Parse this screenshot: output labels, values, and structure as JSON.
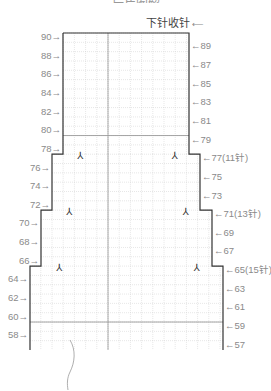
{
  "figure": {
    "top_title_partial": "后片图解",
    "caption": "下针收针",
    "caption_arrow": "⟵"
  },
  "grid": {
    "row_height_px": 5.33,
    "top_row": 90,
    "bottom_row": 57,
    "emphasis_lines_rows": [
      80,
      60
    ],
    "center_col_x": 108
  },
  "left_labels": [
    {
      "row": 90,
      "text": "90"
    },
    {
      "row": 88,
      "text": "88"
    },
    {
      "row": 86,
      "text": "86"
    },
    {
      "row": 84,
      "text": "84"
    },
    {
      "row": 82,
      "text": "82"
    },
    {
      "row": 80,
      "text": "80"
    },
    {
      "row": 78,
      "text": "78"
    },
    {
      "row": 76,
      "text": "76"
    },
    {
      "row": 74,
      "text": "74"
    },
    {
      "row": 72,
      "text": "72"
    },
    {
      "row": 70,
      "text": "70"
    },
    {
      "row": 68,
      "text": "68"
    },
    {
      "row": 66,
      "text": "66"
    },
    {
      "row": 64,
      "text": "64"
    },
    {
      "row": 62,
      "text": "62"
    },
    {
      "row": 60,
      "text": "60"
    },
    {
      "row": 58,
      "text": "58"
    }
  ],
  "right_labels": [
    {
      "row": 89,
      "text": "89"
    },
    {
      "row": 87,
      "text": "87"
    },
    {
      "row": 85,
      "text": "85"
    },
    {
      "row": 83,
      "text": "83"
    },
    {
      "row": 81,
      "text": "81"
    },
    {
      "row": 79,
      "text": "79"
    },
    {
      "row": 77,
      "text": "77(11针)"
    },
    {
      "row": 75,
      "text": "75"
    },
    {
      "row": 73,
      "text": "73"
    },
    {
      "row": 71,
      "text": "71(13针)"
    },
    {
      "row": 69,
      "text": "69"
    },
    {
      "row": 67,
      "text": "67"
    },
    {
      "row": 65,
      "text": "65(15针)"
    },
    {
      "row": 63,
      "text": "63"
    },
    {
      "row": 61,
      "text": "61"
    },
    {
      "row": 59,
      "text": "59"
    },
    {
      "row": 57,
      "text": "57"
    }
  ],
  "decrease_symbols": [
    {
      "row": 77,
      "side": "left",
      "glyph": "⅄"
    },
    {
      "row": 77,
      "side": "right",
      "glyph": "⅄"
    },
    {
      "row": 71,
      "side": "left",
      "glyph": "⅄"
    },
    {
      "row": 71,
      "side": "right",
      "glyph": "⅄"
    },
    {
      "row": 65,
      "side": "left",
      "glyph": "⅄"
    },
    {
      "row": 65,
      "side": "right",
      "glyph": "⅄"
    }
  ],
  "colors": {
    "outline": "#333333",
    "grid_minor": "#cfcfcf",
    "grid_major": "#9a9a9a",
    "label": "#8a8a8a"
  }
}
